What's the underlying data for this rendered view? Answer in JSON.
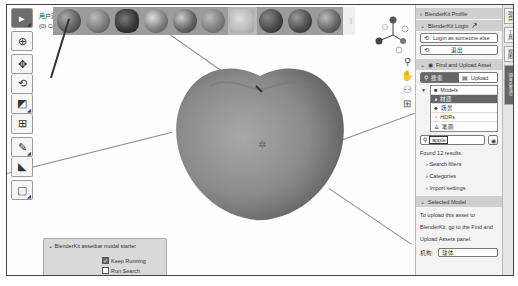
{
  "viewport": {
    "header_line1": "用户透视",
    "header_line2": "(0) Co...",
    "toolbar": [
      {
        "name": "select-tool",
        "icon": "▸",
        "active": true
      },
      {
        "name": "cursor-tool",
        "icon": "⊕"
      },
      {
        "name": "move-tool",
        "icon": "✥"
      },
      {
        "name": "rotate-tool",
        "icon": "⟲"
      },
      {
        "name": "scale-tool",
        "icon": "◩"
      },
      {
        "name": "transform-tool",
        "icon": "⊞"
      },
      {
        "name": "annotate-tool",
        "icon": "✎"
      },
      {
        "name": "measure-tool",
        "icon": "◣"
      },
      {
        "name": "add-cube-tool",
        "icon": "▢"
      }
    ],
    "assetbar": {
      "items": [
        {
          "color": "#6b6b6b"
        },
        {
          "color": "#7a7a7a"
        },
        {
          "color": "#4a4a4a"
        },
        {
          "color": "#8d8d8d"
        },
        {
          "color": "#5e5e5e"
        },
        {
          "color": "#7d7d7d"
        },
        {
          "color": "#aaaaaa"
        },
        {
          "color": "#4f4f4f"
        },
        {
          "color": "#5a5a5a"
        },
        {
          "color": "#6a6a6a"
        }
      ],
      "highlighted_index": 6
    },
    "nav_icons": [
      "zoom-icon",
      "pan-icon",
      "camera-icon",
      "grid-icon"
    ],
    "modal": {
      "title": "BlenderKit assetbar modal starter",
      "keep_running_label": "Keep Running",
      "keep_running_checked": true,
      "run_search_label": "Run Search",
      "run_search_checked": false
    }
  },
  "panel": {
    "profile_header": "BlenderKit Profile",
    "login_header": "BlenderKit Login",
    "login_as_someone_else": "Login as someone else",
    "logout": "退出",
    "find_upload_header": "Find and Upload Asset",
    "search_tab": "搜索",
    "upload_tab": "Upload",
    "asset_types": [
      {
        "label": "Models",
        "icon": "■"
      },
      {
        "label": "材质",
        "icon": "◕",
        "selected": true
      },
      {
        "label": "场景",
        "icon": "♣"
      },
      {
        "label": "HDRs",
        "icon": "◔"
      },
      {
        "label": "笔刷",
        "icon": "♙"
      }
    ],
    "search_value": "apple",
    "results_text": "Found 12 results.",
    "search_filters": "Search filters",
    "categories": "Categories",
    "import_settings": "Import settings",
    "selected_model_header": "Selected Model",
    "upload_info_1": "To upload this asset to",
    "upload_info_2": "BlenderKit, go to the Find and",
    "upload_info_3": "Upload Assets panel.",
    "name_label": "机构:",
    "name_value": "球体"
  },
  "side_tabs": [
    "项目",
    "工具",
    "视图",
    "BlenderKit"
  ]
}
